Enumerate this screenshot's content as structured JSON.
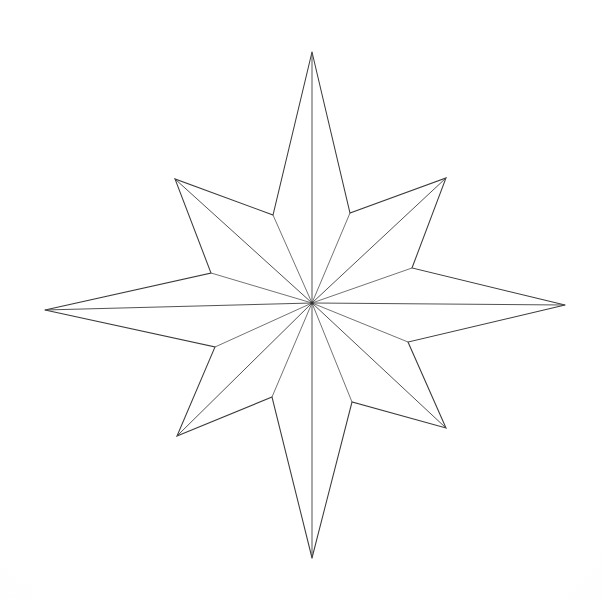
{
  "figure": {
    "subtitle": "Compass rose line drawing",
    "caption": "Hand-drawn outline of an eight-pointed compass star with radial facet lines from the center to each tip.",
    "medium": "pencil line drawing on white paper",
    "background_color": "#fdfdfc",
    "stroke_color": "#3b3b3b",
    "fill_color": "#ffffff",
    "stroke_width": 1.05,
    "canvas": {
      "width": 602,
      "height": 599
    }
  },
  "chart_data": {
    "type": "scatter",
    "xlabel": "",
    "ylabel": "",
    "xlim": [
      0,
      602
    ],
    "ylim": [
      0,
      599
    ],
    "grid": false,
    "legend": "none",
    "center": {
      "x": 312,
      "y": 303,
      "label": "center"
    },
    "point_count": 8,
    "outer_points": [
      {
        "name": "N",
        "label": "north",
        "x": 312,
        "y": 52,
        "radius": 251,
        "angle_deg": 90
      },
      {
        "name": "NE",
        "label": "north-east",
        "x": 446,
        "y": 178,
        "radius": 184,
        "angle_deg": 43
      },
      {
        "name": "E",
        "label": "east",
        "x": 565,
        "y": 305,
        "radius": 253,
        "angle_deg": 0
      },
      {
        "name": "SE",
        "label": "south-east",
        "x": 446,
        "y": 428,
        "radius": 180,
        "angle_deg": -41
      },
      {
        "name": "S",
        "label": "south",
        "x": 312,
        "y": 558,
        "radius": 255,
        "angle_deg": -90
      },
      {
        "name": "SW",
        "label": "south-west",
        "x": 177,
        "y": 436,
        "radius": 192,
        "angle_deg": -138
      },
      {
        "name": "W",
        "label": "west",
        "x": 45,
        "y": 310,
        "radius": 267,
        "angle_deg": 180
      },
      {
        "name": "NW",
        "label": "north-west",
        "x": 175,
        "y": 179,
        "radius": 186,
        "angle_deg": 137
      }
    ],
    "inner_points": [
      {
        "name": "N-NE",
        "x": 350,
        "y": 213,
        "radius": 97
      },
      {
        "name": "NE-E",
        "x": 412,
        "y": 268,
        "radius": 106
      },
      {
        "name": "E-SE",
        "x": 408,
        "y": 342,
        "radius": 102
      },
      {
        "name": "SE-S",
        "x": 352,
        "y": 402,
        "radius": 108
      },
      {
        "name": "S-SW",
        "x": 272,
        "y": 397,
        "radius": 102
      },
      {
        "name": "SW-W",
        "x": 215,
        "y": 347,
        "radius": 104
      },
      {
        "name": "W-NW",
        "x": 211,
        "y": 273,
        "radius": 106
      },
      {
        "name": "NW-N",
        "x": 273,
        "y": 215,
        "radius": 96
      }
    ],
    "radial_lines": 16
  },
  "labels": {
    "figure_name": "eight-pointed-star",
    "point_names": [
      "N",
      "NE",
      "E",
      "SE",
      "S",
      "SW",
      "W",
      "NW"
    ]
  }
}
